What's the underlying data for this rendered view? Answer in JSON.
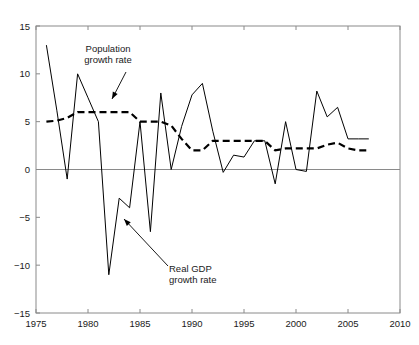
{
  "chart_data": {
    "type": "line",
    "title": "",
    "subtitle": "",
    "xlabel": "",
    "ylabel": "",
    "xlim": [
      1975,
      2010
    ],
    "ylim": [
      -15,
      15
    ],
    "xticks": [
      1975,
      1980,
      1985,
      1990,
      1995,
      2000,
      2005,
      2010
    ],
    "xtick_labels": [
      "1975",
      "1980",
      "1985",
      "1990",
      "1995",
      "2000",
      "2005",
      "2010"
    ],
    "yticks": [
      -15,
      -10,
      -5,
      0,
      5,
      10,
      15
    ],
    "ytick_labels": [
      "-15",
      "-10",
      "-5",
      "0",
      "5",
      "10",
      "15"
    ],
    "grid": false,
    "legend_position": "none",
    "zero_line": 0,
    "x": [
      1976,
      1977,
      1978,
      1979,
      1980,
      1981,
      1982,
      1983,
      1984,
      1985,
      1986,
      1987,
      1988,
      1989,
      1990,
      1991,
      1992,
      1993,
      1994,
      1995,
      1996,
      1997,
      1998,
      1999,
      2000,
      2001,
      2002,
      2003,
      2004,
      2005,
      2006,
      2007
    ],
    "series": [
      {
        "name": "Real GDP growth rate",
        "style": "solid",
        "color": "#000000",
        "values": [
          13.0,
          6.2,
          -1.0,
          10.0,
          7.5,
          5.0,
          -11.0,
          -3.0,
          -4.0,
          5.0,
          -6.5,
          8.0,
          0.0,
          4.5,
          7.8,
          9.0,
          4.0,
          -0.3,
          1.5,
          1.3,
          3.0,
          3.0,
          -1.5,
          5.0,
          0.0,
          -0.2,
          8.2,
          5.5,
          6.5,
          3.2,
          3.2,
          3.2
        ]
      },
      {
        "name": "Population growth rate",
        "style": "dashed",
        "color": "#000000",
        "values": [
          5.0,
          5.1,
          5.4,
          6.0,
          6.0,
          6.0,
          6.0,
          6.0,
          6.0,
          5.0,
          5.0,
          5.0,
          4.6,
          3.2,
          2.0,
          2.0,
          3.0,
          3.0,
          3.0,
          3.0,
          3.0,
          3.0,
          2.0,
          2.2,
          2.2,
          2.2,
          2.2,
          2.6,
          2.8,
          2.2,
          2.0,
          2.0
        ]
      }
    ],
    "annotations": [
      {
        "id": "population-annotation",
        "label_line1": "Population",
        "label_line2": "growth rate",
        "text_x": 108,
        "text_y": 52,
        "arrow_from_x": 126,
        "arrow_from_y": 72,
        "arrow_to_x": 112,
        "arrow_to_y": 99
      },
      {
        "id": "gdp-annotation",
        "label_line1": "Real GDP",
        "label_line2": "growth rate",
        "text_x": 169,
        "text_y": 272,
        "arrow_from_x": 168,
        "arrow_from_y": 266,
        "arrow_to_x": 124,
        "arrow_to_y": 219
      }
    ]
  },
  "axes": {
    "frame_color": "#808080",
    "zero_line_color": "#808080",
    "plot_left": 36,
    "plot_right": 400,
    "plot_top": 26,
    "plot_bottom": 313
  }
}
